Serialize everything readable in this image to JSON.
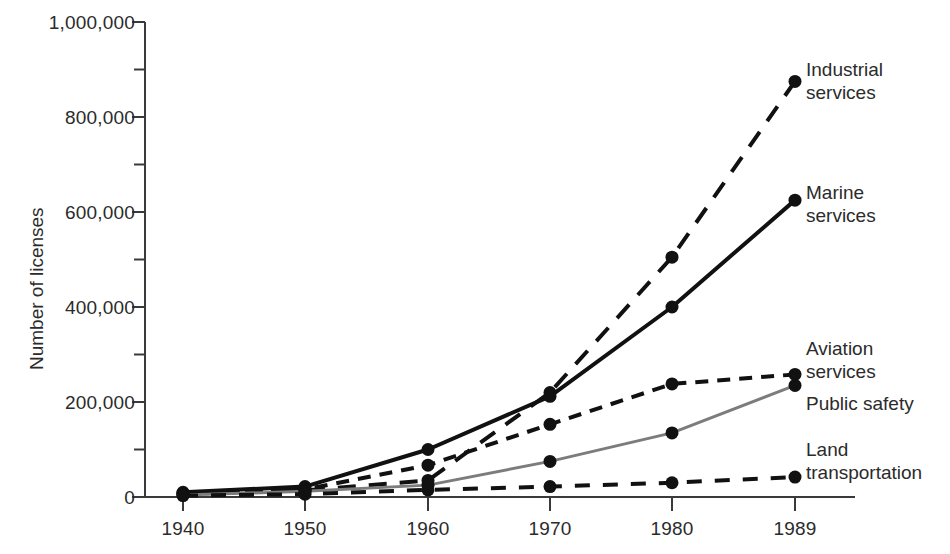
{
  "chart_data": {
    "type": "line",
    "title": "",
    "xlabel": "",
    "ylabel": "Number of licenses",
    "x": [
      1940,
      1950,
      1960,
      1970,
      1980,
      1989
    ],
    "xtick_labels": [
      "1940",
      "1950",
      "1960",
      "1970",
      "1980",
      "1989"
    ],
    "ytick_labels": [
      "0",
      "200,000",
      "400,000",
      "600,000",
      "800,000",
      "1,000,000"
    ],
    "ytick_values": [
      0,
      200000,
      400000,
      600000,
      800000,
      1000000
    ],
    "yminor_values": [
      100000,
      300000,
      500000,
      700000,
      900000
    ],
    "ylim": [
      0,
      1000000
    ],
    "grid": false,
    "legend_position": "right-inline-labels",
    "series": [
      {
        "name": "Industrial services",
        "label": "Industrial\nservices",
        "style": "dashed",
        "color": "#111111",
        "width": 4,
        "values": [
          8000,
          14000,
          35000,
          220000,
          505000,
          875000
        ]
      },
      {
        "name": "Marine services",
        "label": "Marine\nservices",
        "style": "solid",
        "color": "#111111",
        "width": 4,
        "values": [
          10000,
          22000,
          100000,
          212000,
          400000,
          625000
        ]
      },
      {
        "name": "Aviation services",
        "label": "Aviation\nservices",
        "style": "dotted-dash",
        "color": "#111111",
        "width": 4,
        "values": [
          6000,
          16000,
          67000,
          153000,
          238000,
          258000
        ]
      },
      {
        "name": "Public safety",
        "label": "Public safety",
        "style": "solid-gray",
        "color": "#7c7c7c",
        "width": 3,
        "values": [
          4000,
          12000,
          25000,
          75000,
          135000,
          235000
        ]
      },
      {
        "name": "Land transportation",
        "label": "Land\ntransportation",
        "style": "dashed-short",
        "color": "#111111",
        "width": 4,
        "values": [
          3000,
          6000,
          15000,
          22000,
          30000,
          42000
        ]
      }
    ]
  },
  "axes": {
    "y_title": "Number of licenses"
  }
}
